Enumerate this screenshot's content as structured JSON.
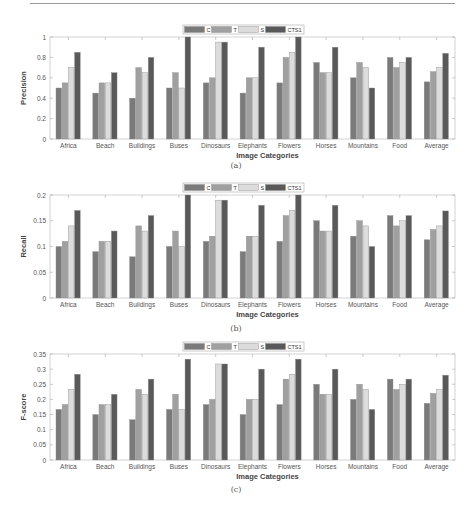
{
  "series_colors": {
    "C": "#7a7a7a",
    "T": "#a0a0a0",
    "S": "#dcdcdc",
    "CTS1": "#595959"
  },
  "legend": [
    "C",
    "T",
    "S",
    "CTS1"
  ],
  "captions": [
    "(a)",
    "(b)",
    "(c)"
  ],
  "chart_data": [
    {
      "type": "bar",
      "title": "",
      "xlabel": "Image Categories",
      "ylabel": "Precision",
      "ylim": [
        0,
        1
      ],
      "yticks": [
        "0",
        "0.2",
        "0.4",
        "0.6",
        "0.8",
        "1"
      ],
      "grid": false,
      "legend_position": "top-center",
      "categories": [
        "Africa",
        "Beach",
        "Buildings",
        "Buses",
        "Dinosaurs",
        "Elephants",
        "Flowers",
        "Horses",
        "Mountains",
        "Food",
        "Average"
      ],
      "series": [
        {
          "name": "C",
          "values": [
            0.5,
            0.45,
            0.4,
            0.5,
            0.55,
            0.45,
            0.55,
            0.75,
            0.6,
            0.8,
            0.56
          ]
        },
        {
          "name": "T",
          "values": [
            0.55,
            0.55,
            0.7,
            0.65,
            0.6,
            0.6,
            0.8,
            0.65,
            0.75,
            0.7,
            0.66
          ]
        },
        {
          "name": "S",
          "values": [
            0.7,
            0.55,
            0.65,
            0.5,
            0.95,
            0.6,
            0.85,
            0.65,
            0.7,
            0.75,
            0.7
          ]
        },
        {
          "name": "CTS1",
          "values": [
            0.85,
            0.65,
            0.8,
            1.0,
            0.95,
            0.9,
            1.0,
            0.9,
            0.5,
            0.8,
            0.84
          ]
        }
      ],
      "caption": "(a)"
    },
    {
      "type": "bar",
      "title": "",
      "xlabel": "Image Categories",
      "ylabel": "Recall",
      "ylim": [
        0,
        0.2
      ],
      "yticks": [
        "0",
        "0.05",
        "0.1",
        "0.15",
        "0.2"
      ],
      "grid": false,
      "legend_position": "top-center",
      "categories": [
        "Africa",
        "Beach",
        "Buildings",
        "Buses",
        "Dinosaurs",
        "Elephants",
        "Flowers",
        "Horses",
        "Mountains",
        "Food",
        "Average"
      ],
      "series": [
        {
          "name": "C",
          "values": [
            0.1,
            0.09,
            0.08,
            0.1,
            0.11,
            0.09,
            0.11,
            0.15,
            0.12,
            0.16,
            0.113
          ]
        },
        {
          "name": "T",
          "values": [
            0.11,
            0.11,
            0.14,
            0.13,
            0.12,
            0.12,
            0.16,
            0.13,
            0.15,
            0.14,
            0.133
          ]
        },
        {
          "name": "S",
          "values": [
            0.14,
            0.11,
            0.13,
            0.1,
            0.19,
            0.12,
            0.17,
            0.13,
            0.14,
            0.15,
            0.14
          ]
        },
        {
          "name": "CTS1",
          "values": [
            0.17,
            0.13,
            0.16,
            0.2,
            0.19,
            0.18,
            0.2,
            0.18,
            0.1,
            0.16,
            0.169
          ]
        }
      ],
      "caption": "(b)"
    },
    {
      "type": "bar",
      "title": "",
      "xlabel": "Image Categories",
      "ylabel": "F-score",
      "ylim": [
        0,
        0.35
      ],
      "yticks": [
        "0",
        "0.05",
        "0.1",
        "0.15",
        "0.2",
        "0.25",
        "0.3",
        "0.35"
      ],
      "grid": false,
      "legend_position": "top-center",
      "categories": [
        "Africa",
        "Beach",
        "Buildings",
        "Buses",
        "Dinosaurs",
        "Elephants",
        "Flowers",
        "Horses",
        "Mountains",
        "Food",
        "Average"
      ],
      "series": [
        {
          "name": "C",
          "values": [
            0.167,
            0.15,
            0.133,
            0.167,
            0.183,
            0.15,
            0.183,
            0.25,
            0.2,
            0.267,
            0.187
          ]
        },
        {
          "name": "T",
          "values": [
            0.183,
            0.183,
            0.233,
            0.217,
            0.2,
            0.2,
            0.267,
            0.217,
            0.25,
            0.233,
            0.22
          ]
        },
        {
          "name": "S",
          "values": [
            0.233,
            0.183,
            0.217,
            0.167,
            0.317,
            0.2,
            0.283,
            0.217,
            0.233,
            0.25,
            0.232
          ]
        },
        {
          "name": "CTS1",
          "values": [
            0.283,
            0.217,
            0.267,
            0.333,
            0.317,
            0.3,
            0.333,
            0.3,
            0.167,
            0.267,
            0.28
          ]
        }
      ],
      "caption": "(c)"
    }
  ]
}
